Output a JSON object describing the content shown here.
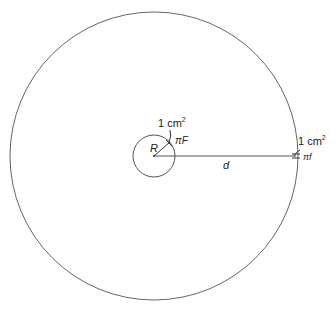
{
  "diagram": {
    "outer_circle": {
      "cx": 154,
      "cy": 156,
      "r": 144
    },
    "inner_circle": {
      "cx": 154,
      "cy": 156,
      "r": 21
    },
    "radius_label": "R",
    "distance_label": "d",
    "inner_area_label": "1 cm",
    "inner_area_exp": "2",
    "inner_flux_label": "πF",
    "outer_area_label": "1 cm",
    "outer_area_exp": "2",
    "outer_flux_label": "πf",
    "stroke_color": "#555555"
  }
}
